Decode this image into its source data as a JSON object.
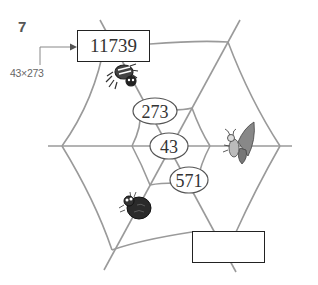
{
  "problem": {
    "number": "7",
    "hint_expression": "43×273",
    "top_box_value": "11739",
    "bottom_box_value": ""
  },
  "web": {
    "ovals": [
      {
        "label": "273"
      },
      {
        "label": "43"
      },
      {
        "label": "571"
      }
    ]
  },
  "decorations": {
    "icons": [
      "spider-icon",
      "butterfly-icon",
      "ladybug-icon",
      "arrow-icon"
    ]
  },
  "colors": {
    "web_line": "#9a9a9a",
    "box_border": "#222222",
    "text": "#333333"
  }
}
